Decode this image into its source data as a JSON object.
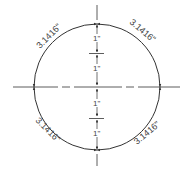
{
  "diagram": {
    "title": "",
    "stroke_color": "#333333",
    "circle": {
      "cx": 97,
      "cy": 87,
      "r": 63
    },
    "arc_labels": [
      {
        "text": "3.1416\"",
        "quadrant": "top-left"
      },
      {
        "text": "3.1416\"",
        "quadrant": "top-right"
      },
      {
        "text": "3.1416\"",
        "quadrant": "bottom-left"
      },
      {
        "text": "3.1416\"",
        "quadrant": "bottom-right"
      }
    ],
    "radius_labels": [
      {
        "text": "1\"",
        "segment": "upper-outer"
      },
      {
        "text": "1\"",
        "segment": "upper-inner"
      },
      {
        "text": "1\"",
        "segment": "lower-inner"
      },
      {
        "text": "1\"",
        "segment": "lower-outer"
      }
    ]
  }
}
